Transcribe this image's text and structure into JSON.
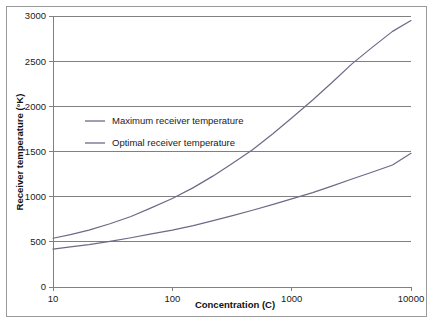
{
  "chart_data": {
    "type": "line",
    "title": "",
    "xlabel": "Concentration (C)",
    "ylabel": "Receiver temperature (°K)",
    "xscale": "log",
    "xlim": [
      10,
      10000
    ],
    "ylim": [
      0,
      3000
    ],
    "xticks": [
      10,
      100,
      1000,
      10000
    ],
    "xtick_labels": [
      "10",
      "100",
      "1000",
      "10000"
    ],
    "yticks": [
      0,
      500,
      1000,
      1500,
      2000,
      2500,
      3000
    ],
    "ytick_labels": [
      "0",
      "500",
      "1000",
      "1500",
      "2000",
      "2500",
      "3000"
    ],
    "grid": "horizontal",
    "legend_position": "inside-upper-left",
    "series": [
      {
        "name": "Maximum receiver temperature",
        "color": "#6b6b86",
        "x": [
          10,
          14,
          20,
          30,
          45,
          65,
          100,
          150,
          220,
          320,
          470,
          700,
          1000,
          1500,
          2200,
          3200,
          4700,
          7000,
          10000
        ],
        "values": [
          540,
          580,
          630,
          700,
          780,
          870,
          980,
          1100,
          1230,
          1370,
          1520,
          1700,
          1870,
          2070,
          2270,
          2470,
          2650,
          2830,
          2950
        ]
      },
      {
        "name": "Optimal receiver temperature",
        "color": "#6b6b86",
        "x": [
          10,
          14,
          20,
          30,
          45,
          65,
          100,
          150,
          220,
          320,
          470,
          700,
          1000,
          1500,
          2200,
          3200,
          4700,
          7000,
          10000
        ],
        "values": [
          420,
          445,
          470,
          505,
          545,
          585,
          630,
          680,
          735,
          790,
          850,
          915,
          975,
          1045,
          1120,
          1195,
          1270,
          1350,
          1480
        ]
      }
    ]
  },
  "legend": {
    "items": [
      {
        "label": "Maximum receiver temperature"
      },
      {
        "label": "Optimal receiver temperature"
      }
    ]
  }
}
